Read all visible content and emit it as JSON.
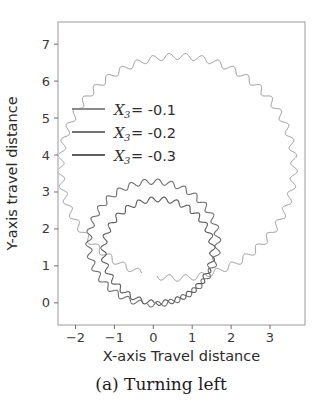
{
  "figure": {
    "caption": "(a) Turning left",
    "background_color": "#ffffff"
  },
  "axes": {
    "xlabel": "X-axis Travel distance",
    "ylabel": "Y-axis travel distance",
    "xticks": [
      "−2",
      "−1",
      "0",
      "1",
      "2",
      "3"
    ],
    "xtick_values": [
      -2,
      -1,
      0,
      1,
      2,
      3
    ],
    "yticks": [
      "0",
      "1",
      "2",
      "3",
      "4",
      "5",
      "6",
      "7"
    ],
    "ytick_values": [
      0,
      1,
      2,
      3,
      4,
      5,
      6,
      7
    ],
    "xlim": [
      -2.45,
      3.9
    ],
    "ylim": [
      -0.6,
      7.6
    ],
    "grid": false,
    "frame_color": "#9a9a9a"
  },
  "legend": {
    "position": "upper-left-inside",
    "entries": [
      {
        "var": "X",
        "sub": "3",
        "eq": " =  -0.1",
        "label": "X₃ = -0.1",
        "value": -0.1,
        "color": "#8a8a8a"
      },
      {
        "var": "X",
        "sub": "3",
        "eq": " =  -0.2",
        "label": "X₃ = -0.2",
        "value": -0.2,
        "color": "#737373"
      },
      {
        "var": "X",
        "sub": "3",
        "eq": " =  -0.3",
        "label": "X₃ = -0.3",
        "value": -0.3,
        "color": "#5e5e5e"
      }
    ]
  },
  "chart_data": {
    "type": "line",
    "title": "(a) Turning left",
    "xlabel": "X-axis Travel distance",
    "ylabel": "Y-axis travel distance",
    "xlim": [
      -2.45,
      3.9
    ],
    "ylim": [
      -0.6,
      7.6
    ],
    "grid": false,
    "legend_position": "upper left",
    "series": [
      {
        "name": "X₃ = -0.1",
        "value": -0.1,
        "color": "#8a8a8a",
        "geometry": "circle",
        "center": [
          0.62,
          3.67
        ],
        "radius": 3.0,
        "start_angle_deg": -100,
        "sweep_deg": 352,
        "oscillation_amplitude": 0.085,
        "oscillation_cycles": 44,
        "x_extent": [
          -2.3,
          3.62
        ],
        "y_extent": [
          0.05,
          7.42
        ]
      },
      {
        "name": "X₃ = -0.2",
        "value": -0.2,
        "color": "#737373",
        "geometry": "circle",
        "center": [
          0.0,
          1.62
        ],
        "radius": 1.66,
        "start_angle_deg": -95,
        "sweep_deg": 356,
        "oscillation_amplitude": 0.075,
        "oscillation_cycles": 30,
        "x_extent": [
          -1.72,
          1.74
        ],
        "y_extent": [
          -0.15,
          3.35
        ]
      },
      {
        "name": "X₃ = -0.3",
        "value": -0.3,
        "color": "#5e5e5e",
        "geometry": "circle",
        "center": [
          0.12,
          1.4
        ],
        "radius": 1.4,
        "start_angle_deg": -92,
        "sweep_deg": 358,
        "oscillation_amplitude": 0.07,
        "oscillation_cycles": 27,
        "x_extent": [
          -1.38,
          1.62
        ],
        "y_extent": [
          -0.12,
          2.88
        ]
      }
    ]
  }
}
